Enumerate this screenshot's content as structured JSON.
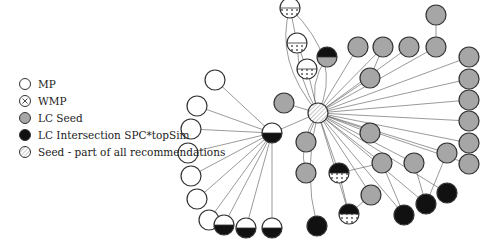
{
  "legend": {
    "items": [
      {
        "key": "mp",
        "label": "MP"
      },
      {
        "key": "wmp",
        "label": "WMP"
      },
      {
        "key": "lcseed",
        "label": "LC Seed"
      },
      {
        "key": "lcint",
        "label": "LC Intersection SPC*topSim"
      },
      {
        "key": "seed",
        "label": "Seed - part of all recommendations"
      }
    ]
  },
  "colors": {
    "gray": "#a6a6a6",
    "black": "#111111",
    "stroke": "#333333",
    "edge": "#555555"
  },
  "graph": {
    "hub_seed": {
      "x": 318,
      "y": 113,
      "r": 10
    },
    "hub_mid": {
      "x": 272,
      "y": 133,
      "r": 10,
      "type": "mp-lcint"
    },
    "nodes": [
      {
        "id": "t1",
        "x": 290,
        "y": 8,
        "type": "mp-wmp"
      },
      {
        "id": "t2",
        "x": 297,
        "y": 43,
        "type": "mp-wmp"
      },
      {
        "id": "t3",
        "x": 307,
        "y": 69,
        "type": "mp-wmp"
      },
      {
        "id": "t4",
        "x": 327,
        "y": 57,
        "type": "lcint-gray"
      },
      {
        "id": "g1",
        "x": 358,
        "y": 47,
        "type": "lcseed"
      },
      {
        "id": "g2",
        "x": 383,
        "y": 47,
        "type": "lcseed"
      },
      {
        "id": "g3",
        "x": 409,
        "y": 47,
        "type": "lcseed"
      },
      {
        "id": "g4",
        "x": 436,
        "y": 47,
        "type": "lcseed"
      },
      {
        "id": "g5",
        "x": 436,
        "y": 15,
        "type": "lcseed"
      },
      {
        "id": "g6",
        "x": 370,
        "y": 78,
        "type": "lcseed"
      },
      {
        "id": "r1",
        "x": 469,
        "y": 57,
        "type": "lcseed"
      },
      {
        "id": "r2",
        "x": 469,
        "y": 79,
        "type": "lcseed"
      },
      {
        "id": "r3",
        "x": 469,
        "y": 100,
        "type": "lcseed"
      },
      {
        "id": "r4",
        "x": 469,
        "y": 121,
        "type": "lcseed"
      },
      {
        "id": "r5",
        "x": 469,
        "y": 143,
        "type": "lcseed"
      },
      {
        "id": "r6",
        "x": 469,
        "y": 164,
        "type": "lcseed"
      },
      {
        "id": "g7",
        "x": 284,
        "y": 103,
        "type": "lcseed"
      },
      {
        "id": "g8",
        "x": 306,
        "y": 142,
        "type": "lcseed"
      },
      {
        "id": "g9",
        "x": 306,
        "y": 173,
        "type": "lcseed"
      },
      {
        "id": "g10",
        "x": 370,
        "y": 133,
        "type": "lcseed"
      },
      {
        "id": "g11",
        "x": 382,
        "y": 163,
        "type": "lcseed"
      },
      {
        "id": "g12",
        "x": 414,
        "y": 163,
        "type": "lcseed"
      },
      {
        "id": "g13",
        "x": 447,
        "y": 153,
        "type": "lcseed"
      },
      {
        "id": "g14",
        "x": 371,
        "y": 195,
        "type": "lcseed"
      },
      {
        "id": "w1",
        "x": 339,
        "y": 173,
        "type": "lcint-wmp"
      },
      {
        "id": "w2",
        "x": 349,
        "y": 214,
        "type": "lcint-wmp"
      },
      {
        "id": "b1",
        "x": 317,
        "y": 226,
        "type": "lcint"
      },
      {
        "id": "b2",
        "x": 404,
        "y": 215,
        "type": "lcint"
      },
      {
        "id": "b3",
        "x": 426,
        "y": 204,
        "type": "lcint"
      },
      {
        "id": "b4",
        "x": 447,
        "y": 193,
        "type": "lcint"
      },
      {
        "id": "m1",
        "x": 215,
        "y": 80,
        "type": "mp"
      },
      {
        "id": "m2",
        "x": 197,
        "y": 106,
        "type": "mp"
      },
      {
        "id": "m3",
        "x": 191,
        "y": 129,
        "type": "mp"
      },
      {
        "id": "m4",
        "x": 188,
        "y": 153,
        "type": "mp"
      },
      {
        "id": "m5",
        "x": 191,
        "y": 176,
        "type": "mp"
      },
      {
        "id": "m6",
        "x": 197,
        "y": 199,
        "type": "mp"
      },
      {
        "id": "m7",
        "x": 209,
        "y": 220,
        "type": "mp"
      },
      {
        "id": "h1",
        "x": 224,
        "y": 225,
        "type": "mp-lcint"
      },
      {
        "id": "h2",
        "x": 246,
        "y": 228,
        "type": "mp-lcint"
      },
      {
        "id": "h3",
        "x": 272,
        "y": 228,
        "type": "mp-lcint"
      }
    ]
  }
}
